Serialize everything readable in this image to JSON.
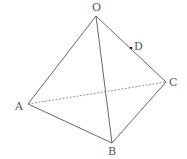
{
  "diagram": {
    "type": "tetrahedron",
    "vertices": {
      "O": {
        "label": "O",
        "x": 96,
        "y": 16,
        "lx": 92,
        "ly": 11
      },
      "A": {
        "label": "A",
        "x": 28,
        "y": 104,
        "lx": 15,
        "ly": 110
      },
      "B": {
        "label": "B",
        "x": 112,
        "y": 143,
        "lx": 108,
        "ly": 155
      },
      "C": {
        "label": "C",
        "x": 166,
        "y": 82,
        "lx": 169,
        "ly": 86
      },
      "D": {
        "label": "D",
        "x": 131,
        "y": 48,
        "lx": 134,
        "ly": 50
      }
    },
    "edges": [
      {
        "from": "O",
        "to": "A",
        "style": "solid"
      },
      {
        "from": "O",
        "to": "B",
        "style": "solid"
      },
      {
        "from": "O",
        "to": "C",
        "style": "solid"
      },
      {
        "from": "A",
        "to": "B",
        "style": "solid"
      },
      {
        "from": "B",
        "to": "C",
        "style": "solid"
      },
      {
        "from": "A",
        "to": "C",
        "style": "dashed"
      }
    ],
    "points": [
      {
        "name": "D",
        "on_edge": "OC"
      }
    ]
  }
}
